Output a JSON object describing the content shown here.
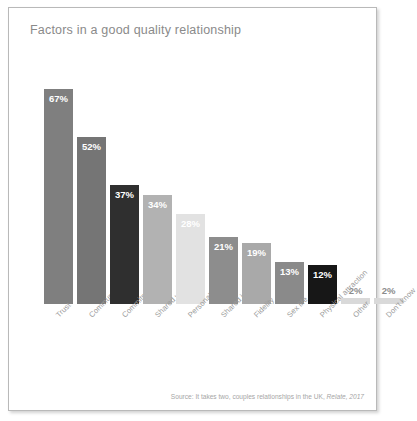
{
  "card": {
    "border_color": "#b9b9b9",
    "background": "#ffffff"
  },
  "title": "Factors in a good quality relationship",
  "source": {
    "prefix": "Source: It takes two, couples relationships in the UK, ",
    "italic": "Relate, 2017"
  },
  "chart_data": {
    "type": "bar",
    "title": "Factors in a good quality relationship",
    "xlabel": "",
    "ylabel": "",
    "ylim": [
      0,
      75
    ],
    "grid": false,
    "legend": null,
    "value_suffix": "%",
    "categories": [
      "Trust",
      "Communication",
      "Commitment",
      "Shared values",
      "Personality",
      "Shared interests",
      "Fidelity",
      "Sex life",
      "Physical attraction",
      "Other",
      "Don't know"
    ],
    "values": [
      67,
      52,
      37,
      34,
      28,
      21,
      19,
      13,
      12,
      2,
      2
    ],
    "value_labels": [
      "67%",
      "52%",
      "37%",
      "34%",
      "28%",
      "21%",
      "19%",
      "13%",
      "12%",
      "2%",
      "2%"
    ],
    "bar_colors": [
      "#7f7f7f",
      "#757575",
      "#2f2f2f",
      "#b2b2b2",
      "#e2e2e2",
      "#8d8d8d",
      "#a9a9a9",
      "#8a8a8a",
      "#171717",
      "#d9d9d9",
      "#d9d9d9"
    ],
    "label_placement": [
      "inside",
      "inside",
      "inside",
      "inside",
      "inside",
      "inside",
      "inside",
      "inside",
      "inside",
      "outside",
      "outside"
    ],
    "label_colors": [
      "#ffffff",
      "#ffffff",
      "#ffffff",
      "#ffffff",
      "#ffffff",
      "#ffffff",
      "#ffffff",
      "#ffffff",
      "#ffffff",
      "#8c8c8c",
      "#8c8c8c"
    ]
  }
}
